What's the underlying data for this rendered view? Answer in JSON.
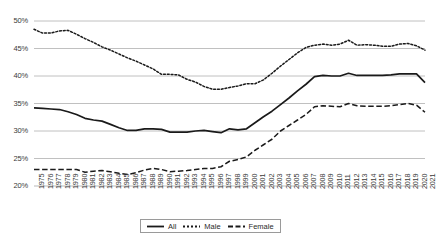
{
  "chart_data": {
    "type": "line",
    "title": "",
    "subtitle": "",
    "xlabel": "",
    "ylabel": "",
    "grid": true,
    "legend_position": "bottom-center",
    "ylim": [
      20,
      50
    ],
    "yticks": [
      20,
      25,
      30,
      35,
      40,
      45,
      50
    ],
    "ytick_labels": [
      "20%",
      "25%",
      "30%",
      "35%",
      "40%",
      "45%",
      "50%"
    ],
    "xlim": [
      1975,
      2021
    ],
    "x": [
      1975,
      1976,
      1977,
      1978,
      1979,
      1980,
      1981,
      1982,
      1983,
      1984,
      1985,
      1986,
      1987,
      1988,
      1989,
      1990,
      1991,
      1992,
      1993,
      1994,
      1995,
      1996,
      1997,
      1998,
      1999,
      2000,
      2001,
      2002,
      2003,
      2004,
      2005,
      2006,
      2007,
      2008,
      2009,
      2010,
      2011,
      2012,
      2013,
      2014,
      2015,
      2016,
      2017,
      2018,
      2019,
      2020,
      2021
    ],
    "categories": [
      "1975",
      "1976",
      "1977",
      "1978",
      "1979",
      "1980",
      "1981",
      "1982",
      "1983",
      "1984",
      "1985",
      "1986",
      "1987",
      "1988",
      "1989",
      "1990",
      "1991",
      "1992",
      "1993",
      "1994",
      "1995",
      "1996",
      "1997",
      "1998",
      "1999",
      "2000",
      "2001",
      "2002",
      "2003",
      "2004",
      "2005",
      "2006",
      "2007",
      "2008",
      "2009",
      "2010",
      "2011",
      "2012",
      "2013",
      "2014",
      "2015",
      "2016",
      "2017",
      "2018",
      "2019",
      "2020",
      "2021"
    ],
    "series": [
      {
        "name": "All",
        "style": "solid",
        "color": "#1a1a1a",
        "values": [
          34.2,
          34.1,
          34.0,
          33.9,
          33.5,
          33.0,
          32.3,
          32.0,
          31.8,
          31.2,
          30.6,
          30.1,
          30.1,
          30.4,
          30.4,
          30.3,
          29.8,
          29.8,
          29.8,
          30.0,
          30.1,
          29.9,
          29.7,
          30.4,
          30.2,
          30.4,
          31.5,
          32.6,
          33.6,
          34.8,
          36.0,
          37.3,
          38.5,
          39.9,
          40.1,
          40.0,
          40.0,
          40.5,
          40.1,
          40.1,
          40.1,
          40.1,
          40.2,
          40.4,
          40.4,
          40.4,
          38.8
        ]
      },
      {
        "name": "Male",
        "style": "dotted",
        "color": "#1a1a1a",
        "values": [
          48.5,
          47.8,
          47.8,
          48.2,
          48.3,
          47.6,
          46.8,
          46.1,
          45.3,
          44.7,
          44.0,
          43.3,
          42.7,
          42.0,
          41.3,
          40.3,
          40.3,
          40.2,
          39.4,
          38.9,
          38.1,
          37.6,
          37.6,
          37.9,
          38.2,
          38.6,
          38.6,
          39.3,
          40.5,
          41.8,
          43.0,
          44.2,
          45.2,
          45.6,
          45.8,
          45.6,
          45.8,
          46.5,
          45.6,
          45.7,
          45.6,
          45.4,
          45.4,
          45.8,
          45.9,
          45.5,
          44.7
        ]
      },
      {
        "name": "Female",
        "style": "dashed",
        "color": "#1a1a1a",
        "values": [
          23.0,
          23.0,
          23.0,
          23.0,
          23.0,
          23.0,
          22.5,
          22.7,
          22.8,
          22.6,
          22.3,
          22.1,
          22.4,
          22.9,
          23.2,
          23.0,
          22.6,
          22.7,
          22.8,
          23.0,
          23.2,
          23.2,
          23.5,
          24.5,
          24.8,
          25.3,
          26.5,
          27.5,
          28.5,
          30.0,
          31.0,
          32.0,
          33.0,
          34.4,
          34.6,
          34.5,
          34.4,
          35.0,
          34.6,
          34.5,
          34.5,
          34.5,
          34.6,
          34.8,
          35.0,
          34.7,
          33.4
        ]
      }
    ],
    "legend_entries": [
      {
        "label": "All",
        "style": "solid"
      },
      {
        "label": "Male",
        "style": "dotted"
      },
      {
        "label": "Female",
        "style": "dashed"
      }
    ]
  },
  "axis_colors": {
    "gridline": "#b9b9b9",
    "text": "#3a3a3a",
    "series": "#1a1a1a"
  }
}
